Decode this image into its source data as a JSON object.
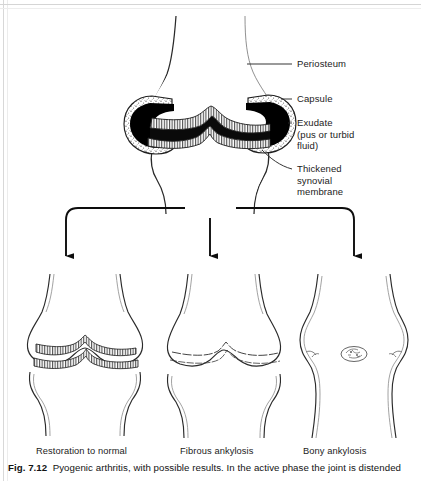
{
  "figure": {
    "number": "Fig. 7.12",
    "caption_text": "Pyogenic arthritis, with possible results. In the active phase the joint is distended",
    "title_alt": "Pyogenic arthritis, with possible results"
  },
  "main_diagram": {
    "name": "pyogenic-arthritis-active-joint",
    "labels": [
      {
        "id": "periosteum",
        "text": "Periosteum"
      },
      {
        "id": "capsule",
        "text": "Capsule"
      },
      {
        "id": "exudate",
        "text": "Exudate\n(pus or turbid\nfluid)"
      },
      {
        "id": "thickened-synovial-membrane",
        "text": "Thickened\nsynovial\nmembrane"
      }
    ]
  },
  "outcomes": [
    {
      "id": "restoration-to-normal",
      "caption": "Restoration to normal"
    },
    {
      "id": "fibrous-ankylosis",
      "caption": "Fibrous ankylosis"
    },
    {
      "id": "bony-ankylosis",
      "caption": "Bony ankylosis"
    }
  ],
  "colors": {
    "ink": "#1b1b1b",
    "line": "#2a2a2a",
    "exudate_fill": "#000000",
    "capsule_stipple": "#6f6f6f",
    "paper": "#ffffff",
    "cartilage_hatch": "#333333"
  }
}
